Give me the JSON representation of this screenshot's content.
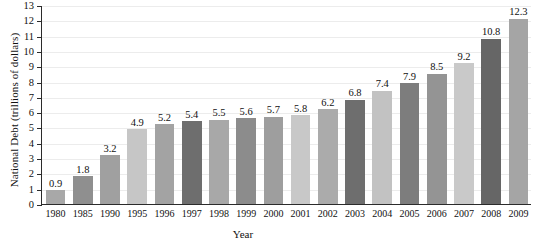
{
  "chart_data": {
    "type": "bar",
    "title": "",
    "xlabel": "Year",
    "ylabel": "National Debt (trillions of dollars)",
    "categories": [
      "1980",
      "1985",
      "1990",
      "1995",
      "1996",
      "1997",
      "1998",
      "1999",
      "2000",
      "2001",
      "2002",
      "2003",
      "2004",
      "2005",
      "2006",
      "2007",
      "2008",
      "2009"
    ],
    "values": [
      0.9,
      1.8,
      3.2,
      4.9,
      5.2,
      5.4,
      5.5,
      5.6,
      5.7,
      5.8,
      6.2,
      6.8,
      7.4,
      7.9,
      8.5,
      9.2,
      10.8,
      12.3
    ],
    "value_labels": [
      "0.9",
      "1.8",
      "3.2",
      "4.9",
      "5.2",
      "5.4",
      "5.5",
      "5.6",
      "5.7",
      "5.8",
      "6.2",
      "6.8",
      "7.4",
      "7.9",
      "8.5",
      "9.2",
      "10.8",
      "12.3"
    ],
    "bar_colors": [
      "#a8a8a8",
      "#8f8f8f",
      "#a0a0a0",
      "#c6c6c6",
      "#a3a3a3",
      "#6e6e6e",
      "#a8a8a8",
      "#8c8c8c",
      "#9e9e9e",
      "#c8c8c8",
      "#ababab",
      "#6e6e6e",
      "#c2c2c2",
      "#7d7d7d",
      "#949494",
      "#c9c9c9",
      "#666666",
      "#a5a5a5"
    ],
    "ylim": [
      0,
      13
    ],
    "yticks": [
      0,
      1,
      2,
      3,
      4,
      5,
      6,
      7,
      8,
      9,
      10,
      11,
      12,
      13
    ],
    "ytick_labels": [
      "0",
      "1",
      "2",
      "3",
      "4",
      "5",
      "6",
      "7",
      "8",
      "9",
      "10",
      "11",
      "12",
      "13"
    ],
    "grid": true,
    "legend": "none",
    "axis_color": "#2b2b2b",
    "grid_color": "#ececec"
  }
}
